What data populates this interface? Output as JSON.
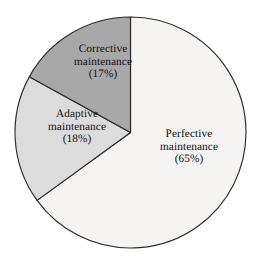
{
  "figure": {
    "background_color": "#ffffff",
    "outline_color": "#2b2b2b"
  },
  "chart_data": {
    "type": "pie",
    "title": "",
    "subtitle": "",
    "xlabel": "",
    "ylabel": "",
    "grid": false,
    "legend_position": "none",
    "label_placement": "inside-slice",
    "start_angle_deg": 0,
    "direction": "clockwise",
    "units": "percent",
    "total": 100,
    "categories": [
      "Perfective maintenance",
      "Adaptive maintenance",
      "Corrective maintenance"
    ],
    "values": [
      65,
      18,
      17
    ],
    "colors": [
      "#f5f4f2",
      "#dcdcdc",
      "#a8a8a8"
    ],
    "slices": [
      {
        "name": "Perfective maintenance",
        "name_line_1": "Perfective",
        "name_line_2": "maintenance",
        "value": 65,
        "value_label": "(65%)",
        "color": "#f5f4f2",
        "start_deg": 0,
        "end_deg": 234
      },
      {
        "name": "Adaptive maintenance",
        "name_line_1": "Adaptive",
        "name_line_2": "maintenance",
        "value": 18,
        "value_label": "(18%)",
        "color": "#dcdcdc",
        "start_deg": 234,
        "end_deg": 298.8
      },
      {
        "name": "Corrective maintenance",
        "name_line_1": "Corrective",
        "name_line_2": "maintenance",
        "value": 17,
        "value_label": "(17%)",
        "color": "#a8a8a8",
        "start_deg": 298.8,
        "end_deg": 360
      }
    ]
  }
}
